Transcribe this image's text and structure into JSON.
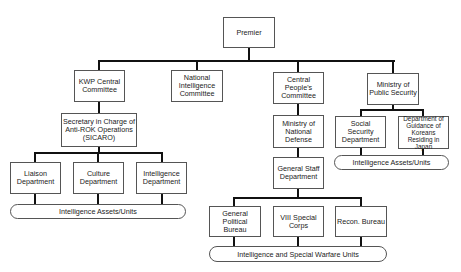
{
  "nodes": {
    "premier": "Premier",
    "kwp": "KWP Central Committee",
    "nic": "National Intelligence Committee",
    "cpc": "Central People's Committee",
    "mps": "Ministry of Public Security",
    "sicaro": "Secretary in Charge of Anti-ROK Operations (SICARO)",
    "mnd": "Ministry of National Defense",
    "ssd": "Social Security Department",
    "dgkj": "Department of Guidance of Koreans Residing in Japan",
    "liaison": "Liaison Department",
    "culture": "Culture Department",
    "intel": "Intelligence Department",
    "gsd": "General Staff Department",
    "gpb": "General Political Bureau",
    "viii": "VIII Special Corps",
    "recon": "Recon. Bureau"
  },
  "groups": {
    "left_assets": "Intelligence Assets/Units",
    "right_assets": "Intelligence Assets/Units",
    "bottom_units": "Intelligence and Special Warfare Units"
  }
}
